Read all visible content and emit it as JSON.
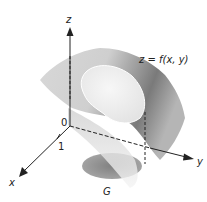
{
  "diagram": {
    "axes": {
      "z_label": "z",
      "y_label": "y",
      "x_label": "x",
      "origin_label": "0",
      "tick_label": "1"
    },
    "surface_label": "z = f(x, y)",
    "region_label": "G",
    "colors": {
      "axis": "#222222",
      "surface_dark": "#6a6a6a",
      "surface_light": "#e8e8e8",
      "patch": "#f2f2f2",
      "shadow": "#5a5a5a"
    }
  }
}
